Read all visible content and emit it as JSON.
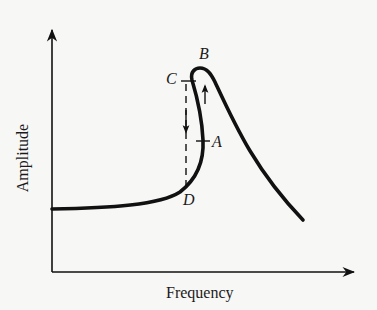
{
  "figure": {
    "xlabel": "Frequency",
    "ylabel": "Amplitude",
    "points": {
      "A": "A",
      "B": "B",
      "C": "C",
      "D": "D"
    },
    "colors": {
      "background": "#f7f7f6",
      "ink": "#111111"
    }
  }
}
